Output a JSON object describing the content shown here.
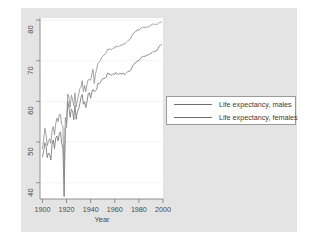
{
  "chart_data": {
    "type": "line",
    "title": "",
    "xlabel": "Year",
    "ylabel": "",
    "xlim": [
      1898,
      2000
    ],
    "ylim": [
      36,
      80.5
    ],
    "xticks": [
      1900,
      1920,
      1940,
      1960,
      1980,
      2000
    ],
    "yticks": [
      40,
      50,
      60,
      70,
      80
    ],
    "grid": "horizontal-faint",
    "legend_position": "right-middle",
    "series": [
      {
        "name": "Life expectancy, males",
        "color": "#6e6e6e",
        "x": [
          1900,
          1901,
          1902,
          1903,
          1904,
          1905,
          1906,
          1907,
          1908,
          1909,
          1910,
          1911,
          1912,
          1913,
          1914,
          1915,
          1916,
          1917,
          1918,
          1919,
          1920,
          1921,
          1922,
          1923,
          1924,
          1925,
          1926,
          1927,
          1928,
          1929,
          1930,
          1931,
          1932,
          1933,
          1934,
          1935,
          1936,
          1937,
          1938,
          1939,
          1940,
          1941,
          1942,
          1943,
          1944,
          1945,
          1946,
          1947,
          1948,
          1949,
          1950,
          1951,
          1952,
          1953,
          1954,
          1955,
          1956,
          1957,
          1958,
          1959,
          1960,
          1961,
          1962,
          1963,
          1964,
          1965,
          1966,
          1967,
          1968,
          1969,
          1970,
          1971,
          1972,
          1973,
          1974,
          1975,
          1976,
          1977,
          1978,
          1979,
          1980,
          1981,
          1982,
          1983,
          1984,
          1985,
          1986,
          1987,
          1988,
          1989,
          1990,
          1991,
          1992,
          1993,
          1994,
          1995,
          1996,
          1997,
          1998,
          1999
        ],
        "y": [
          46.3,
          47.6,
          49.8,
          49.1,
          46.2,
          47.3,
          46.9,
          45.6,
          49.5,
          50.5,
          48.4,
          50.9,
          51.5,
          50.3,
          52.0,
          52.5,
          49.6,
          48.4,
          36.6,
          53.5,
          53.6,
          60.0,
          58.4,
          56.1,
          58.1,
          57.6,
          55.5,
          59.0,
          55.6,
          57.4,
          58.1,
          59.4,
          61.0,
          61.7,
          59.3,
          59.9,
          58.5,
          60.0,
          61.9,
          62.1,
          60.8,
          62.3,
          62.9,
          62.4,
          62.6,
          62.9,
          64.4,
          64.4,
          64.6,
          65.2,
          65.6,
          65.6,
          65.8,
          66.0,
          67.0,
          66.7,
          66.7,
          66.4,
          66.6,
          66.8,
          66.6,
          67.1,
          66.8,
          66.6,
          66.9,
          66.8,
          66.7,
          67.0,
          66.6,
          66.8,
          67.1,
          67.4,
          67.4,
          67.6,
          68.2,
          68.8,
          69.1,
          69.5,
          69.6,
          70.0,
          70.0,
          70.4,
          70.8,
          71.0,
          71.1,
          71.1,
          71.2,
          71.4,
          71.4,
          71.7,
          71.8,
          72.0,
          72.3,
          72.2,
          72.4,
          72.5,
          73.1,
          73.6,
          73.8,
          74.1
        ]
      },
      {
        "name": "Life expectancy, females",
        "color": "#8c8c8c",
        "x": [
          1900,
          1901,
          1902,
          1903,
          1904,
          1905,
          1906,
          1907,
          1908,
          1909,
          1910,
          1911,
          1912,
          1913,
          1914,
          1915,
          1916,
          1917,
          1918,
          1919,
          1920,
          1921,
          1922,
          1923,
          1924,
          1925,
          1926,
          1927,
          1928,
          1929,
          1930,
          1931,
          1932,
          1933,
          1934,
          1935,
          1936,
          1937,
          1938,
          1939,
          1940,
          1941,
          1942,
          1943,
          1944,
          1945,
          1946,
          1947,
          1948,
          1949,
          1950,
          1951,
          1952,
          1953,
          1954,
          1955,
          1956,
          1957,
          1958,
          1959,
          1960,
          1961,
          1962,
          1963,
          1964,
          1965,
          1966,
          1967,
          1968,
          1969,
          1970,
          1971,
          1972,
          1973,
          1974,
          1975,
          1976,
          1977,
          1978,
          1979,
          1980,
          1981,
          1982,
          1983,
          1984,
          1985,
          1986,
          1987,
          1988,
          1989,
          1990,
          1991,
          1992,
          1993,
          1994,
          1995,
          1996,
          1997,
          1998,
          1999
        ],
        "y": [
          48.3,
          50.6,
          53.4,
          52.0,
          49.1,
          50.2,
          50.8,
          49.7,
          52.8,
          53.8,
          51.8,
          54.4,
          55.9,
          55.0,
          56.8,
          56.8,
          54.3,
          54.0,
          42.2,
          56.0,
          54.6,
          61.8,
          61.0,
          58.5,
          61.5,
          60.6,
          59.0,
          62.1,
          58.7,
          60.3,
          61.6,
          63.1,
          63.5,
          65.1,
          62.4,
          63.9,
          62.4,
          64.3,
          65.3,
          65.4,
          65.2,
          66.8,
          67.9,
          64.4,
          66.8,
          67.9,
          69.4,
          69.7,
          70.0,
          70.7,
          71.1,
          71.4,
          71.6,
          72.0,
          72.8,
          72.8,
          72.9,
          72.7,
          72.9,
          73.2,
          73.1,
          73.6,
          73.5,
          73.4,
          73.7,
          73.8,
          73.8,
          74.2,
          74.0,
          74.4,
          74.7,
          75.0,
          75.1,
          75.3,
          76.1,
          76.6,
          76.8,
          77.2,
          77.2,
          77.8,
          77.4,
          77.8,
          78.1,
          78.1,
          78.2,
          78.2,
          78.2,
          78.3,
          78.3,
          78.5,
          78.8,
          78.9,
          79.1,
          78.8,
          79.0,
          78.9,
          79.1,
          79.4,
          79.5,
          79.4
        ]
      }
    ]
  },
  "axis": {
    "x_title": "Year",
    "x_tick_labels": [
      "1900",
      "1920",
      "1940",
      "1960",
      "1980",
      "2000"
    ],
    "y_tick_labels": [
      "80",
      "70",
      "60",
      "50",
      "40"
    ]
  },
  "legend": {
    "items": [
      {
        "label": "Life expectancy, males"
      },
      {
        "label": "Life expectancy, females"
      }
    ]
  },
  "colors": {
    "panel_background": "#e4e4e4",
    "plot_background": "#ffffff",
    "males_line": "#6e6e6e",
    "females_line": "#8c8c8c",
    "axis": "#7a7a7a",
    "text": "#4a4a4a"
  }
}
